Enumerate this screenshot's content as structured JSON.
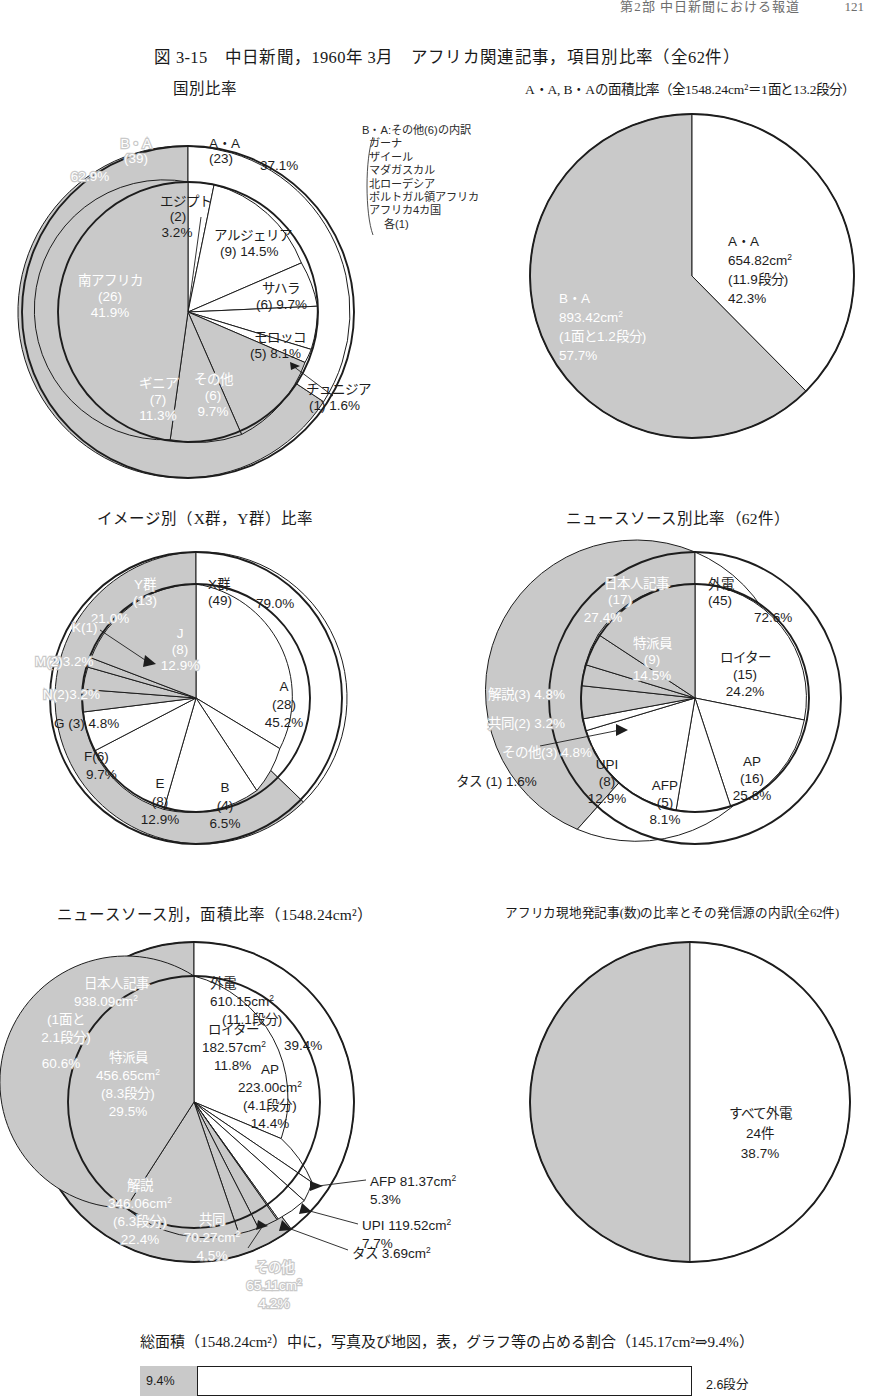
{
  "running_header": {
    "text": "第2部  中日新聞における報道",
    "page_number": "121"
  },
  "figure": {
    "title": "図 3-15　中日新聞，1960年 3月　アフリカ関連記事，項目別比率（全62件）"
  },
  "panels": {
    "p1": {
      "title": "国別比率"
    },
    "p2": {
      "title": "A・A, B・Aの面積比率（全1548.24cm²＝1面と13.2段分）"
    },
    "p3": {
      "title": "イメージ別（X群，Y群）比率"
    },
    "p4": {
      "title": "ニュースソース別比率（62件）"
    },
    "p5": {
      "title": "ニュースソース別，面積比率（1548.24cm²）"
    },
    "p6": {
      "title": "アフリカ現地発記事(数)の比率とその発信源の内訳(全62件)"
    }
  },
  "note_box": {
    "heading": "B・A:その他(6)の内訳",
    "items": [
      "ガーナ",
      "ザイール",
      "マダガスカル",
      "北ローデシア",
      "ポルトガル領アフリカ",
      "アフリカ4カ国"
    ],
    "tail": "各(1)"
  },
  "bottom": {
    "caption": "総面積（1548.24cm²）中に，写真及び地図，表，グラフ等の占める割合（145.17cm²⇒9.4%）",
    "bar_value_label": "9.4%",
    "bar_right_label": "2.6段分",
    "bar_fill_percent": 9.4
  },
  "chart_data": [
    {
      "id": "country-ratio",
      "type": "pie",
      "title": "国別比率",
      "total_label": "全62件",
      "rings": [
        {
          "name": "outer",
          "slices": [
            {
              "label": "A・A",
              "count": "(23)",
              "percent": 37.1,
              "percent_label": "37.1%",
              "shade": "light"
            },
            {
              "label": "B・A",
              "count": "(39)",
              "percent": 62.9,
              "percent_label": "62.9%",
              "shade": "dark"
            }
          ]
        },
        {
          "name": "inner",
          "slices": [
            {
              "label": "エジプト",
              "count": "(2)",
              "percent": 3.2,
              "percent_label": "3.2%",
              "shade": "light"
            },
            {
              "label": "アルジェリア",
              "count": "(9)",
              "percent": 14.5,
              "percent_label": "14.5%",
              "shade": "light"
            },
            {
              "label": "サハラ",
              "count": "(6)",
              "percent": 9.7,
              "percent_label": "9.7%",
              "shade": "light"
            },
            {
              "label": "モロッコ",
              "count": "(5)",
              "percent": 8.1,
              "percent_label": "8.1%",
              "shade": "light"
            },
            {
              "label": "チュニジア",
              "count": "(1)",
              "percent": 1.6,
              "percent_label": "1.6%",
              "shade": "light"
            },
            {
              "label": "その他",
              "count": "(6)",
              "percent": 9.7,
              "percent_label": "9.7%",
              "shade": "dark"
            },
            {
              "label": "ギニア",
              "count": "(7)",
              "percent": 11.3,
              "percent_label": "11.3%",
              "shade": "dark"
            },
            {
              "label": "南アフリカ",
              "count": "(26)",
              "percent": 41.9,
              "percent_label": "41.9%",
              "shade": "dark"
            }
          ]
        }
      ]
    },
    {
      "id": "area-ratio-aa-ba",
      "type": "pie",
      "title": "A・A, B・Aの面積比率",
      "total_label": "全1548.24cm²＝1面と13.2段分",
      "slices": [
        {
          "label": "A・A",
          "area": "654.82cm²",
          "dan": "(11.9段分)",
          "percent": 42.3,
          "percent_label": "42.3%",
          "shade": "light"
        },
        {
          "label": "B・A",
          "area": "893.42cm²",
          "dan": "(1面と1.2段分)",
          "percent": 57.7,
          "percent_label": "57.7%",
          "shade": "dark"
        }
      ]
    },
    {
      "id": "image-group-ratio",
      "type": "pie",
      "title": "イメージ別（X群，Y群）比率",
      "rings": [
        {
          "name": "outer",
          "slices": [
            {
              "label": "X群",
              "count": "(49)",
              "percent": 79.0,
              "percent_label": "79.0%",
              "shade": "light"
            },
            {
              "label": "Y群",
              "count": "(13)",
              "percent": 21.0,
              "percent_label": "21.0%",
              "shade": "dark"
            }
          ]
        },
        {
          "name": "inner",
          "slices": [
            {
              "label": "A",
              "count": "(28)",
              "percent": 45.2,
              "percent_label": "45.2%",
              "shade": "light"
            },
            {
              "label": "B",
              "count": "(4)",
              "percent": 6.5,
              "percent_label": "6.5%",
              "shade": "light"
            },
            {
              "label": "E",
              "count": "(8)",
              "percent": 12.9,
              "percent_label": "12.9%",
              "shade": "light"
            },
            {
              "label": "F",
              "count": "(6)",
              "percent": 9.7,
              "percent_label": "9.7%",
              "shade": "light"
            },
            {
              "label": "G",
              "count": "(3)",
              "percent": 4.8,
              "percent_label": "4.8%",
              "shade": "light"
            },
            {
              "label": "N",
              "count": "(2)",
              "percent": 3.2,
              "percent_label": "3.2%",
              "shade": "dark"
            },
            {
              "label": "M",
              "count": "(2)",
              "percent": 3.2,
              "percent_label": "3.2%",
              "shade": "dark"
            },
            {
              "label": "K",
              "count": "(1)",
              "percent": 1.6,
              "percent_label": "",
              "shade": "dark"
            },
            {
              "label": "J",
              "count": "(8)",
              "percent": 12.9,
              "percent_label": "12.9%",
              "shade": "dark"
            }
          ]
        }
      ]
    },
    {
      "id": "news-source-ratio",
      "type": "pie",
      "title": "ニュースソース別比率",
      "total_label": "62件",
      "rings": [
        {
          "name": "outer",
          "slices": [
            {
              "label": "外電",
              "count": "(45)",
              "percent": 72.6,
              "percent_label": "72.6%",
              "shade": "light"
            },
            {
              "label": "日本人記事",
              "count": "(17)",
              "percent": 27.4,
              "percent_label": "27.4%",
              "shade": "dark"
            }
          ]
        },
        {
          "name": "inner",
          "slices": [
            {
              "label": "ロイター",
              "count": "(15)",
              "percent": 24.2,
              "percent_label": "24.2%",
              "shade": "light"
            },
            {
              "label": "AP",
              "count": "(16)",
              "percent": 25.8,
              "percent_label": "25.8%",
              "shade": "light"
            },
            {
              "label": "AFP",
              "count": "(5)",
              "percent": 8.1,
              "percent_label": "8.1%",
              "shade": "light"
            },
            {
              "label": "UPI",
              "count": "(8)",
              "percent": 12.9,
              "percent_label": "12.9%",
              "shade": "light"
            },
            {
              "label": "タス",
              "count": "(1)",
              "percent": 1.6,
              "percent_label": "1.6%",
              "shade": "light"
            },
            {
              "label": "その他",
              "count": "(3)",
              "percent": 4.8,
              "percent_label": "4.8%",
              "shade": "dark"
            },
            {
              "label": "共同",
              "count": "(2)",
              "percent": 3.2,
              "percent_label": "3.2%",
              "shade": "dark"
            },
            {
              "label": "解説",
              "count": "(3)",
              "percent": 4.8,
              "percent_label": "4.8%",
              "shade": "dark"
            },
            {
              "label": "特派員",
              "count": "(9)",
              "percent": 14.5,
              "percent_label": "14.5%",
              "shade": "dark"
            }
          ]
        }
      ]
    },
    {
      "id": "news-source-area-ratio",
      "type": "pie",
      "title": "ニュースソース別，面積比率",
      "total_label": "1548.24cm²",
      "rings": [
        {
          "name": "outer",
          "slices": [
            {
              "label": "外電",
              "area": "610.15cm²",
              "dan": "(11.1段分)",
              "percent": 39.4,
              "percent_label": "39.4%",
              "shade": "light"
            },
            {
              "label": "日本人記事",
              "area": "938.09cm²",
              "dan": "(1面と2.1段分)",
              "percent": 60.6,
              "percent_label": "60.6%",
              "shade": "dark"
            }
          ]
        },
        {
          "name": "inner",
          "slices": [
            {
              "label": "ロイター",
              "area": "182.57cm²",
              "dan": "",
              "percent": 11.8,
              "percent_label": "11.8%",
              "shade": "light"
            },
            {
              "label": "AP",
              "area": "223.00cm²",
              "dan": "(4.1段分)",
              "percent": 14.4,
              "percent_label": "14.4%",
              "shade": "light"
            },
            {
              "label": "AFP",
              "area": "81.37cm²",
              "dan": "",
              "percent": 5.3,
              "percent_label": "5.3%",
              "shade": "light"
            },
            {
              "label": "UPI",
              "area": "119.52cm²",
              "dan": "",
              "percent": 7.7,
              "percent_label": "7.7%",
              "shade": "light"
            },
            {
              "label": "タス",
              "area": "3.69cm²",
              "dan": "",
              "percent": 0.2,
              "percent_label": "",
              "shade": "light"
            },
            {
              "label": "その他",
              "area": "65.11cm²",
              "dan": "",
              "percent": 4.2,
              "percent_label": "4.2%",
              "shade": "dark"
            },
            {
              "label": "共同",
              "area": "70.27cm²",
              "dan": "",
              "percent": 4.5,
              "percent_label": "4.5%",
              "shade": "dark"
            },
            {
              "label": "解説",
              "area": "346.06cm²",
              "dan": "(6.3段分)",
              "percent": 22.4,
              "percent_label": "22.4%",
              "shade": "dark"
            },
            {
              "label": "特派員",
              "area": "456.65cm²",
              "dan": "(8.3段分)",
              "percent": 29.5,
              "percent_label": "29.5%",
              "shade": "dark"
            }
          ]
        }
      ]
    },
    {
      "id": "africa-local-origin",
      "type": "pie",
      "title": "アフリカ現地発記事(数)の比率とその発信源の内訳",
      "total_label": "全62件",
      "slices": [
        {
          "label": "すべて外電",
          "count": "24件",
          "percent": 38.7,
          "percent_label": "38.7%",
          "shade": "light"
        },
        {
          "label": "",
          "count": "",
          "percent": 61.3,
          "percent_label": "",
          "shade": "dark"
        }
      ]
    },
    {
      "id": "photo-map-share-bar",
      "type": "bar",
      "title": "総面積（1548.24cm²）中に，写真及び地図，表，グラフ等の占める割合",
      "categories": [
        "写真及び地図，表，グラフ等"
      ],
      "values": [
        9.4
      ],
      "value_labels": [
        "9.4%"
      ],
      "annotation": "145.17cm²⇒9.4%",
      "right_label": "2.6段分",
      "ylim": [
        0,
        100
      ]
    }
  ],
  "labels": {
    "p1": {
      "outer": [
        {
          "l1": "A・A",
          "l2": "(23)",
          "l3": "37.1%"
        },
        {
          "l1": "B・A",
          "l2": "(39)",
          "l3": "62.9%"
        }
      ],
      "inner": [
        {
          "l1": "エジプト",
          "l2": "(2)",
          "l3": "3.2%"
        },
        {
          "l1": "アルジェリア",
          "l2": "(9) 14.5%"
        },
        {
          "l1": "サハラ",
          "l2": "(6) 9.7%"
        },
        {
          "l1": "モロッコ",
          "l2": "(5) 8.1%"
        },
        {
          "l1": "チュニジア",
          "l2": "(1) 1.6%"
        },
        {
          "l1": "その他",
          "l2": "(6)",
          "l3": "9.7%"
        },
        {
          "l1": "ギニア",
          "l2": "(7)",
          "l3": "11.3%"
        },
        {
          "l1": "南アフリカ",
          "l2": "(26)",
          "l3": "41.9%"
        }
      ]
    },
    "p2": [
      {
        "l1": "A・A",
        "l2": "654.82cm",
        "sup": "2",
        "l3": "(11.9段分)",
        "l4": "42.3%"
      },
      {
        "l1": "B・A",
        "l2": "893.42cm",
        "sup": "2",
        "l3": "(1面と1.2段分)",
        "l4": "57.7%"
      }
    ],
    "p3": {
      "outer": [
        {
          "l1": "X群",
          "l2": "(49)",
          "l3": "79.0%"
        },
        {
          "l1": "Y群",
          "l2": "(13)",
          "l3": "21.0%"
        }
      ],
      "inner": [
        {
          "l1": "A",
          "l2": "(28)",
          "l3": "45.2%"
        },
        {
          "l1": "B",
          "l2": "(4)",
          "l3": "6.5%"
        },
        {
          "l1": "E",
          "l2": "(8)",
          "l3": "12.9%"
        },
        {
          "l1": "F(6)",
          "l2": "9.7%"
        },
        {
          "l1": "G (3) 4.8%"
        },
        {
          "l1": "N(2)3.2%"
        },
        {
          "l1": "M(2)3.2%"
        },
        {
          "l1": "K(1)"
        },
        {
          "l1": "J",
          "l2": "(8)",
          "l3": "12.9%"
        }
      ]
    },
    "p4": {
      "outer": [
        {
          "l1": "外電",
          "l2": "(45)",
          "l3": "72.6%"
        },
        {
          "l1": "日本人記事",
          "l2": "(17)",
          "l3": "27.4%"
        }
      ],
      "inner": [
        {
          "l1": "ロイター",
          "l2": "(15)",
          "l3": "24.2%"
        },
        {
          "l1": "AP",
          "l2": "(16)",
          "l3": "25.8%"
        },
        {
          "l1": "AFP",
          "l2": "(5)",
          "l3": "8.1%"
        },
        {
          "l1": "UPI",
          "l2": "(8)",
          "l3": "12.9%"
        },
        {
          "l1": "タス (1) 1.6%"
        },
        {
          "l1": "その他(3) 4.8%"
        },
        {
          "l1": "共同(2) 3.2%"
        },
        {
          "l1": "解説(3) 4.8%"
        },
        {
          "l1": "特派員",
          "l2": "(9)",
          "l3": "14.5%"
        }
      ]
    },
    "p5": {
      "outer": [
        {
          "l1": "外電",
          "l2": "610.15cm",
          "sup": "2",
          "l3": "(11.1段分)",
          "l4": "39.4%"
        },
        {
          "l1": "日本人記事",
          "l2": "938.09cm",
          "sup": "2",
          "l3": "(1面と",
          "l4": "2.1段分)",
          "l5": "60.6%"
        }
      ],
      "inner": [
        {
          "l1": "ロイター",
          "l2": "182.57cm",
          "sup": "2",
          "l3": "11.8%"
        },
        {
          "l1": "AP",
          "l2": "223.00cm",
          "sup": "2",
          "l3": "(4.1段分)",
          "l4": "14.4%"
        },
        {
          "l1": "AFP 81.37cm",
          "sup": "2",
          "l2": "5.3%"
        },
        {
          "l1": "UPI 119.52cm",
          "sup": "2",
          "l2": "7.7%"
        },
        {
          "l1": "タス 3.69cm",
          "sup": "2"
        },
        {
          "l1": "その他",
          "l2": "65.11cm",
          "sup": "2",
          "l3": "4.2%"
        },
        {
          "l1": "共同",
          "l2": "70.27cm",
          "sup": "2",
          "l3": "4.5%"
        },
        {
          "l1": "解説",
          "l2": "346.06cm",
          "sup": "2",
          "l3": "(6.3段分)",
          "l4": "22.4%"
        },
        {
          "l1": "特派員",
          "l2": "456.65cm",
          "sup": "2",
          "l3": "(8.3段分)",
          "l4": "29.5%"
        }
      ]
    },
    "p6": [
      {
        "l1": "すべて外電",
        "l2": "24件",
        "l3": "38.7%"
      }
    ]
  }
}
